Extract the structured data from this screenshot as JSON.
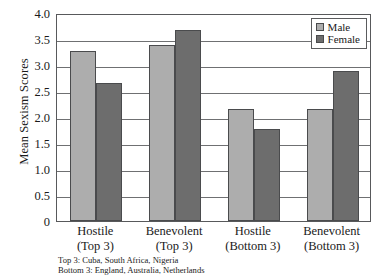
{
  "chart_data": {
    "type": "bar",
    "title": "",
    "xlabel": "",
    "ylabel": "Mean Sexism Scores",
    "ylim": [
      0,
      4.0
    ],
    "grid": true,
    "legend_position": "top-right",
    "categories": [
      "Hostile\n(Top 3)",
      "Benevolent\n(Top 3)",
      "Hostile\n(Bottom 3)",
      "Benevolent\n(Bottom 3)"
    ],
    "category_lines": [
      {
        "line1": "Hostile",
        "line2": "(Top 3)"
      },
      {
        "line1": "Benevolent",
        "line2": "(Top 3)"
      },
      {
        "line1": "Hostile",
        "line2": "(Bottom 3)"
      },
      {
        "line1": "Benevolent",
        "line2": "(Bottom 3)"
      }
    ],
    "series": [
      {
        "name": "Male",
        "color": "#adadad",
        "values": [
          3.26,
          3.38,
          2.15,
          2.16
        ]
      },
      {
        "name": "Female",
        "color": "#6d6d6d",
        "values": [
          2.65,
          3.68,
          1.76,
          2.88
        ]
      }
    ],
    "yticks": [
      "0",
      "0.5",
      "1.0",
      "1.5",
      "2.0",
      "2.5",
      "3.0",
      "3.5",
      "4.0"
    ],
    "ytick_values": [
      0,
      0.5,
      1.0,
      1.5,
      2.0,
      2.5,
      3.0,
      3.5,
      4.0
    ],
    "annotations": [
      "Top 3: Cuba, South Africa, Nigeria",
      "Bottom 3: England, Australia, Netherlands"
    ]
  },
  "legend": {
    "items": [
      {
        "label": "Male",
        "swatch": "male-swatch"
      },
      {
        "label": "Female",
        "swatch": "female-swatch"
      }
    ]
  },
  "footnotes": {
    "top": "Top 3: Cuba, South Africa, Nigeria",
    "bottom": "Bottom 3: England, Australia, Netherlands"
  }
}
